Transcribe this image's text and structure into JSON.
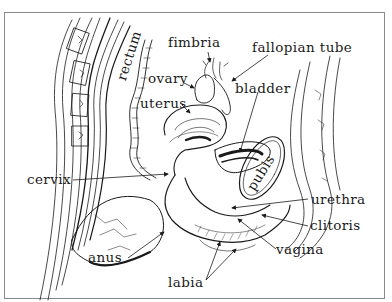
{
  "diagram": {
    "colors": {
      "ink": "#1a1a1a",
      "frame": "#8a8a8a",
      "background": "#ffffff"
    },
    "labels": {
      "rectum": "rectum",
      "fimbria": "fimbria",
      "fallopian_tube": "fallopian tube",
      "ovary": "ovary",
      "uterus": "uterus",
      "bladder": "bladder",
      "pubis": "pubis",
      "cervix": "cervix",
      "urethra": "urethra",
      "clitoris": "clitoris",
      "vagina": "vagina",
      "anus": "anus",
      "labia": "labia"
    }
  }
}
